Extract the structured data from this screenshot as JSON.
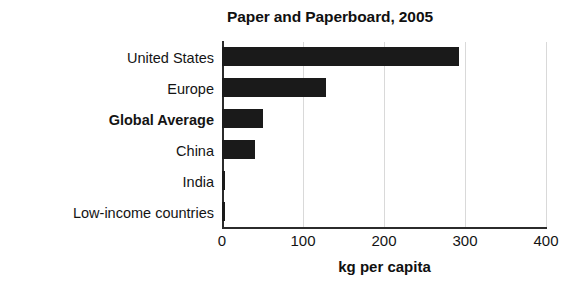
{
  "chart_data": {
    "type": "bar",
    "orientation": "horizontal",
    "title": "Paper and Paperboard, 2005",
    "xlabel": "kg per capita",
    "ylabel": "",
    "categories": [
      "United States",
      "Europe",
      "Global Average",
      "China",
      "India",
      "Low-income countries"
    ],
    "values": [
      292,
      129,
      51,
      41,
      4,
      4
    ],
    "emphasized_categories": [
      "Global Average"
    ],
    "xlim": [
      0,
      400
    ],
    "xticks": [
      0,
      100,
      200,
      300,
      400
    ],
    "xtick_labels": [
      "0",
      "100",
      "200",
      "300",
      "400"
    ],
    "grid": "vertical-only",
    "legend": "none",
    "bar_color": "#1a1a1a",
    "gridline_color": "#d9d9d9",
    "axis_color": "#2b2b2b",
    "background_color": "#ffffff"
  }
}
